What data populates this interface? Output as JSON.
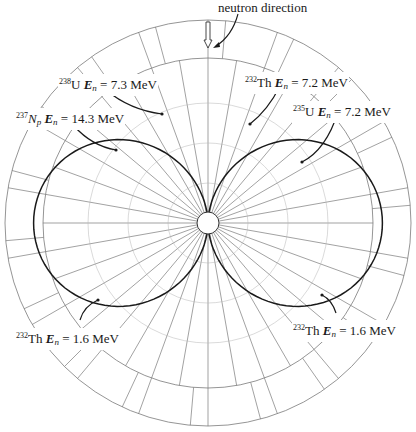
{
  "figure": {
    "title_label": "neutron direction",
    "center": [
      208,
      223
    ],
    "outer_radius": 203,
    "inner_ring_radius": 165,
    "hub_radius": 11,
    "spoke_step_deg": 10,
    "grid_rings": [
      203,
      165
    ],
    "outer_band_segments_step_deg": 10,
    "outer_band_offset_deg": 5,
    "colors": {
      "grid": "#7a7a7a",
      "curve": "#1a1a1a",
      "text": "#1a1a1a",
      "background": "#ffffff"
    }
  },
  "labels": [
    {
      "id": "u238",
      "mass": "238",
      "element": "U",
      "energy_symbol": "E",
      "energy_sub": "n",
      "value": "= 7.3 MeV",
      "x": 58,
      "y": 74
    },
    {
      "id": "np237",
      "mass": "237",
      "element": "N",
      "element_sub": "p",
      "energy_symbol": "E",
      "energy_sub": "n",
      "value": "= 14.3 MeV",
      "x": 15,
      "y": 108
    },
    {
      "id": "th232_72",
      "mass": "232",
      "element": "Th",
      "energy_symbol": "E",
      "energy_sub": "n",
      "value": "= 7.2 MeV",
      "x": 244,
      "y": 72
    },
    {
      "id": "u235",
      "mass": "235",
      "element": "U",
      "energy_symbol": "E",
      "energy_sub": "n",
      "value": "= 7.2 MeV",
      "x": 292,
      "y": 101
    },
    {
      "id": "th232_16_left",
      "mass": "232",
      "element": "Th",
      "energy_symbol": "E",
      "energy_sub": "n",
      "value": "= 1.6 MeV",
      "x": 15,
      "y": 328
    },
    {
      "id": "th232_16_right",
      "mass": "232",
      "element": "Th",
      "energy_symbol": "E",
      "energy_sub": "n",
      "value": "= 1.6 MeV",
      "x": 292,
      "y": 320
    }
  ],
  "chart_data": {
    "type": "polar",
    "annotation": "neutron direction",
    "angle_axis": "angle from neutron direction (0° = up)",
    "radial_axis": "relative fragment yield",
    "series": [
      {
        "name": "237Np En = 14.3 MeV",
        "shape": "forward-backward peaked",
        "r_0deg": 160,
        "r_90deg": 133
      },
      {
        "name": "238U En = 7.3 MeV",
        "shape": "forward-backward peaked",
        "r_0deg": 160,
        "r_90deg": 111
      },
      {
        "name": "232Th En = 7.2 MeV",
        "shape": "forward-backward peaked",
        "r_0deg": 160,
        "r_90deg": 98
      },
      {
        "name": "235U En = 7.2 MeV",
        "shape": "forward-backward peaked",
        "r_0deg": 160,
        "r_90deg": 78
      },
      {
        "name": "232Th En = 1.6 MeV (a)",
        "shape": "forward-backward peaked",
        "r_0deg": 160,
        "r_90deg": 53
      },
      {
        "name": "232Th En = 1.6 MeV (b)",
        "shape": "sideways peaked (max at 90°)",
        "r_0deg": 0,
        "r_90deg": 178
      }
    ],
    "grid": {
      "rings": 2,
      "spokes_deg": 10
    }
  }
}
